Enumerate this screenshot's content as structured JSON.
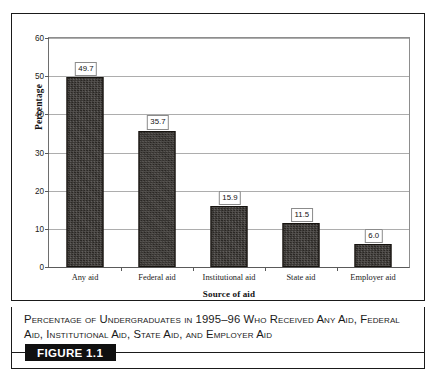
{
  "figure": {
    "tag": "FIGURE 1.1",
    "caption": "Percentage of Undergraduates in 1995–96 Who Received Any Aid, Federal Aid, Institutional Aid, State Aid, and Employer Aid"
  },
  "chart_data": {
    "type": "bar",
    "title": "",
    "xlabel": "Source of aid",
    "ylabel": "Percentage",
    "categories": [
      "Any aid",
      "Federal aid",
      "Institutional aid",
      "State aid",
      "Employer aid"
    ],
    "values": [
      49.7,
      35.7,
      15.9,
      11.5,
      6.0
    ],
    "value_labels": [
      "49.7",
      "35.7",
      "15.9",
      "11.5",
      "6.0"
    ],
    "ylim": [
      0,
      60
    ],
    "yticks": [
      0,
      10,
      20,
      30,
      40,
      50,
      60
    ],
    "ytick_labels": [
      "0",
      "10",
      "20",
      "30",
      "40",
      "50",
      "60"
    ],
    "grid": true,
    "legend": false,
    "bar_color": "#2a2724",
    "gridline_color": "#adadad"
  }
}
